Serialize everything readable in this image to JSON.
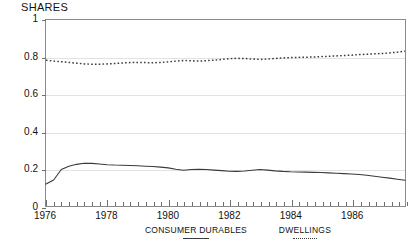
{
  "chart_data": {
    "type": "line",
    "title": "SHARES",
    "xlabel": "",
    "ylabel": "",
    "ylim": [
      0,
      1
    ],
    "xlim": [
      1976,
      1987.75
    ],
    "yticks": [
      "0",
      "0.2",
      "0.4",
      "0.6",
      "0.8",
      "1"
    ],
    "ytick_values": [
      0,
      0.2,
      0.4,
      0.6,
      0.8,
      1
    ],
    "xticks": [
      "1976",
      "1978",
      "1980",
      "1982",
      "1984",
      "1986"
    ],
    "xtick_values": [
      1976,
      1978,
      1980,
      1982,
      1984,
      1986
    ],
    "grid": true,
    "legend_position": "below",
    "x": [
      1976.0,
      1976.25,
      1976.5,
      1976.75,
      1977.0,
      1977.25,
      1977.5,
      1977.75,
      1978.0,
      1978.25,
      1978.5,
      1978.75,
      1979.0,
      1979.25,
      1979.5,
      1979.75,
      1980.0,
      1980.25,
      1980.5,
      1980.75,
      1981.0,
      1981.25,
      1981.5,
      1981.75,
      1982.0,
      1982.25,
      1982.5,
      1982.75,
      1983.0,
      1983.25,
      1983.5,
      1983.75,
      1984.0,
      1984.25,
      1984.5,
      1984.75,
      1985.0,
      1985.25,
      1985.5,
      1985.75,
      1986.0,
      1986.25,
      1986.5,
      1986.75,
      1987.0,
      1987.25,
      1987.5,
      1987.75
    ],
    "series": [
      {
        "name": "CONSUMER DURABLES",
        "style": "solid",
        "color": "#3a3a3a",
        "values": [
          0.118,
          0.14,
          0.196,
          0.214,
          0.224,
          0.23,
          0.229,
          0.226,
          0.222,
          0.22,
          0.219,
          0.218,
          0.216,
          0.214,
          0.212,
          0.209,
          0.205,
          0.198,
          0.192,
          0.196,
          0.198,
          0.196,
          0.193,
          0.19,
          0.187,
          0.186,
          0.188,
          0.192,
          0.196,
          0.193,
          0.189,
          0.186,
          0.184,
          0.183,
          0.182,
          0.181,
          0.18,
          0.178,
          0.176,
          0.174,
          0.172,
          0.169,
          0.165,
          0.16,
          0.155,
          0.15,
          0.144,
          0.138
        ]
      },
      {
        "name": "DWELLINGS",
        "style": "dotted",
        "color": "#3a3a3a",
        "values": [
          0.784,
          0.779,
          0.776,
          0.772,
          0.768,
          0.764,
          0.762,
          0.762,
          0.764,
          0.766,
          0.769,
          0.771,
          0.772,
          0.771,
          0.77,
          0.772,
          0.775,
          0.779,
          0.782,
          0.781,
          0.779,
          0.781,
          0.784,
          0.788,
          0.792,
          0.794,
          0.793,
          0.79,
          0.788,
          0.79,
          0.793,
          0.796,
          0.798,
          0.799,
          0.8,
          0.801,
          0.803,
          0.805,
          0.807,
          0.809,
          0.811,
          0.814,
          0.816,
          0.818,
          0.82,
          0.823,
          0.827,
          0.832
        ]
      }
    ]
  },
  "legend": [
    {
      "label": "CONSUMER DURABLES",
      "style": "solid"
    },
    {
      "label": "DWELLINGS",
      "style": "dotted"
    }
  ]
}
